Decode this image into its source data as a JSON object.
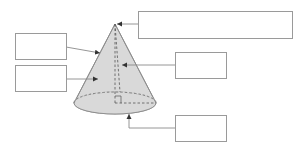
{
  "diagram": {
    "title": "",
    "shape": "cone",
    "colors": {
      "cone_fill": "#d9d9d9",
      "outline": "#8a8a8a",
      "box_border": "#9a9a9a",
      "connector": "#8a8a8a",
      "background": "#ffffff"
    },
    "labels": {
      "apex": "",
      "slant_height": "",
      "curved_surface": "",
      "height": "",
      "base": ""
    }
  }
}
